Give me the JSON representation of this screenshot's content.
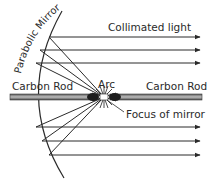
{
  "diagram": {
    "labels": {
      "mirror": "Parabolic Mirror",
      "collimated": "Collimated light",
      "rod_left": "Carbon Rod",
      "rod_right": "Carbon Rod",
      "arc": "Arc",
      "focus": "Focus of mirror"
    },
    "colors": {
      "line": "#2a2a2a",
      "rod_fill": "#9a9a9a",
      "rod_edge": "#3a3a3a",
      "background": "#ffffff"
    },
    "focus_point": [
      104,
      97
    ],
    "upper_ray_points": [
      [
        49,
        37
      ],
      [
        40,
        50
      ],
      [
        36,
        63
      ]
    ],
    "lower_ray_points": [
      [
        36,
        127
      ],
      [
        42,
        141
      ],
      [
        49,
        155
      ]
    ],
    "ray_end_x": 200
  }
}
